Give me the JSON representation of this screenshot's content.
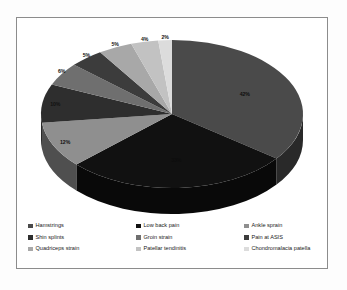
{
  "chart_data": {
    "type": "pie",
    "title": "",
    "subtitle": "",
    "xlabel": "",
    "ylabel": "",
    "three_d": true,
    "legend_position": "bottom",
    "grid": false,
    "data_labels": "percent",
    "categories": [
      "Hamstrings",
      "Low back pain",
      "Ankle sprain",
      "Shin splints",
      "Groin strain",
      "Pain at ASIS",
      "Quadriceps strain",
      "Patellar tendinitis",
      "Chondromalacia patella"
    ],
    "values": [
      42,
      33,
      12,
      10,
      6,
      5,
      5,
      4,
      2
    ],
    "value_labels": [
      "42%",
      "33%",
      "12%",
      "10%",
      "6%",
      "5%",
      "5%",
      "4%",
      "2%"
    ],
    "colors": [
      "#4a4a4a",
      "#111111",
      "#8f8f8f",
      "#2e2e2e",
      "#6f6f6f",
      "#3c3c3c",
      "#a8a8a8",
      "#c2c2c2",
      "#dcdcdc"
    ],
    "slices": [
      {
        "label": "Hamstrings",
        "value": 42,
        "value_label": "42%",
        "color": "#4a4a4a"
      },
      {
        "label": "Low back pain",
        "value": 33,
        "value_label": "33%",
        "color": "#111111"
      },
      {
        "label": "Ankle sprain",
        "value": 12,
        "value_label": "12%",
        "color": "#8f8f8f"
      },
      {
        "label": "Shin splints",
        "value": 10,
        "value_label": "10%",
        "color": "#2e2e2e"
      },
      {
        "label": "Groin strain",
        "value": 6,
        "value_label": "6%",
        "color": "#6f6f6f"
      },
      {
        "label": "Pain at ASIS",
        "value": 5,
        "value_label": "5%",
        "color": "#3c3c3c"
      },
      {
        "label": "Quadriceps strain",
        "value": 5,
        "value_label": "5%",
        "color": "#a8a8a8"
      },
      {
        "label": "Patellar tendinitis",
        "value": 4,
        "value_label": "4%",
        "color": "#c2c2c2"
      },
      {
        "label": "Chondromalacia patella",
        "value": 2,
        "value_label": "2%",
        "color": "#dcdcdc"
      }
    ]
  },
  "legend": {
    "items": [
      {
        "label": "Hamstrings",
        "color": "#4a4a4a"
      },
      {
        "label": "Low back pain",
        "color": "#111111"
      },
      {
        "label": "Ankle sprain",
        "color": "#8f8f8f"
      },
      {
        "label": "Shin splints",
        "color": "#2e2e2e"
      },
      {
        "label": "Groin strain",
        "color": "#6f6f6f"
      },
      {
        "label": "Pain at ASIS",
        "color": "#3c3c3c"
      },
      {
        "label": "Quadriceps strain",
        "color": "#a8a8a8"
      },
      {
        "label": "Patellar tendinitis",
        "color": "#c2c2c2"
      },
      {
        "label": "Chondromalacia patella",
        "color": "#dcdcdc"
      }
    ]
  },
  "style": {
    "frame_border_color": "#8c8c8c",
    "background": "#ffffff",
    "depth_shade_factor": 0.55
  }
}
